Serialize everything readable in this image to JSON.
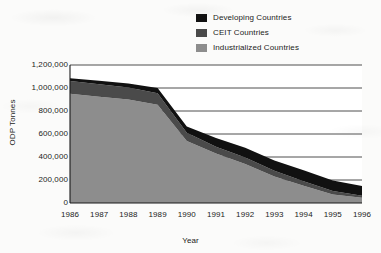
{
  "chart_data": {
    "type": "area",
    "stacked": true,
    "title": "",
    "xlabel": "Year",
    "ylabel": "ODP Tonnes",
    "categories": [
      "1986",
      "1987",
      "1988",
      "1989",
      "1990",
      "1991",
      "1992",
      "1993",
      "1994",
      "1995",
      "1996"
    ],
    "x": [
      1986,
      1987,
      1988,
      1989,
      1990,
      1991,
      1992,
      1993,
      1994,
      1995,
      1996
    ],
    "ylim": [
      0,
      1200000
    ],
    "ytick_values": [
      0,
      200000,
      400000,
      600000,
      800000,
      1000000,
      1200000
    ],
    "ytick_labels": [
      "0",
      "200,000",
      "400,000",
      "600,000",
      "800,000",
      "1,000,000",
      "1,200,000"
    ],
    "grid": true,
    "grid_axis": "y",
    "legend_position": "top-center",
    "series": [
      {
        "name": "Industrialized Countries",
        "color": "#8d8d8d",
        "stack_order": 1,
        "values": [
          950000,
          925000,
          900000,
          855000,
          540000,
          430000,
          340000,
          230000,
          150000,
          75000,
          45000
        ]
      },
      {
        "name": "CEIT Countries",
        "color": "#4a4a4a",
        "stack_order": 2,
        "values": [
          110000,
          108000,
          105000,
          100000,
          70000,
          60000,
          55000,
          50000,
          40000,
          30000,
          18000
        ]
      },
      {
        "name": "Developing Countries",
        "color": "#111111",
        "stack_order": 3,
        "values": [
          25000,
          30000,
          35000,
          45000,
          55000,
          75000,
          85000,
          90000,
          95000,
          90000,
          85000
        ]
      }
    ],
    "cumulative_totals": [
      1085000,
      1063000,
      1040000,
      1000000,
      665000,
      565000,
      480000,
      370000,
      285000,
      195000,
      148000
    ]
  },
  "legend": {
    "items": [
      {
        "label": "Developing Countries",
        "swatch": "#111111"
      },
      {
        "label": "CEIT Countries",
        "swatch": "#4a4a4a"
      },
      {
        "label": "Industrialized Countries",
        "swatch": "#8d8d8d"
      }
    ]
  },
  "axes": {
    "y_title": "ODP Tonnes",
    "x_title": "Year"
  }
}
